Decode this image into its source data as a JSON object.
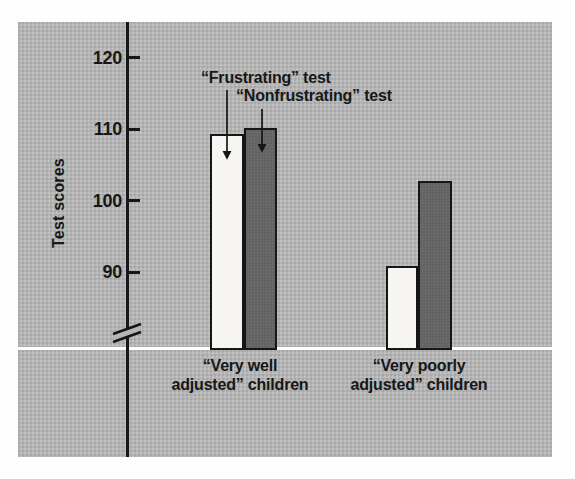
{
  "figure": {
    "panel_color": "#b5b5b5",
    "baseline_color": "#ffffff",
    "ink_color": "#171717",
    "page_color": "#fefefe"
  },
  "chart_data": {
    "type": "bar",
    "title": "",
    "ylabel": "Test scores",
    "xlabel": "",
    "categories": [
      "“Very well adjusted” children",
      "“Very poorly adjusted” children"
    ],
    "category_lines": [
      [
        "“Very well",
        "adjusted” children"
      ],
      [
        "“Very poorly",
        "adjusted” children"
      ]
    ],
    "series": [
      {
        "name": "“Frustrating” test",
        "values": [
          109.3,
          90.8
        ],
        "color": "#f6f5f1"
      },
      {
        "name": "“Nonfrustrating” test",
        "values": [
          110.1,
          102.7
        ],
        "color": "#6a6a6a"
      }
    ],
    "yticks": [
      90,
      100,
      110,
      120
    ],
    "ylim": [
      86,
      123
    ],
    "axis_break": true,
    "grid": false,
    "legend_position": "arrow annotations pointing to first group bars"
  }
}
